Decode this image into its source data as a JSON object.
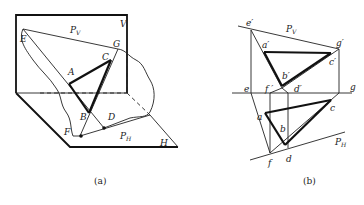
{
  "figure_a": {
    "caption": "(a)",
    "labels": {
      "V": "V",
      "Pv": "P",
      "Pv_sub": "V",
      "E": "E",
      "G": "G",
      "A": "A",
      "C": "C",
      "B": "B",
      "D": "D",
      "F": "F",
      "PH": "P",
      "PH_sub": "H",
      "H": "H"
    }
  },
  "figure_b": {
    "caption": "(b)",
    "labels": {
      "e_p": "e′",
      "Pv": "P",
      "Pv_sub": "V",
      "a_p": "a′",
      "g_p": "g′",
      "c_p": "c′",
      "b_p": "b′",
      "e": "e",
      "f_p": "f ′",
      "d_p": "d′",
      "g": "g",
      "c": "c",
      "a": "a",
      "b": "b",
      "PH": "P",
      "PH_sub": "H",
      "f": "f",
      "d": "d"
    }
  }
}
